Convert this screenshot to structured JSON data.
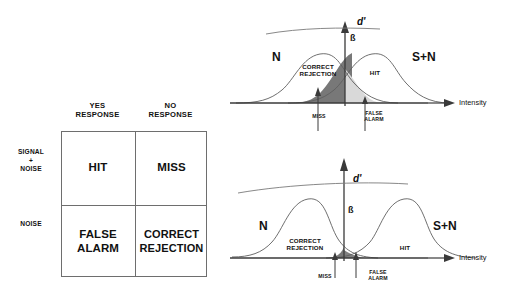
{
  "figure": {
    "background_color": "#ffffff",
    "line_color": "#6e6e6e",
    "text_color": "#111111",
    "dark_fill_color": "#787878",
    "light_fill_color": "#d9d9d9"
  },
  "matrix": {
    "column_headers": [
      {
        "id": "yes",
        "label": "YES\nRESPONSE"
      },
      {
        "id": "no",
        "label": "NO\nRESPONSE"
      }
    ],
    "row_headers": [
      {
        "id": "signal_noise",
        "label": "SIGNAL\n+\nNOISE"
      },
      {
        "id": "noise",
        "label": "NOISE"
      }
    ],
    "cells": [
      {
        "id": "hit",
        "row": "signal_noise",
        "col": "yes",
        "label": "HIT"
      },
      {
        "id": "miss",
        "row": "signal_noise",
        "col": "no",
        "label": "MISS"
      },
      {
        "id": "false_alarm",
        "row": "noise",
        "col": "yes",
        "label": "FALSE\nALARM"
      },
      {
        "id": "correct_rejection",
        "row": "noise",
        "col": "no",
        "label": "CORRECT\nREJECTION"
      }
    ]
  },
  "plots": [
    {
      "id": "low-sensitivity",
      "position": "top",
      "dprime_label": "d'",
      "beta_label": "ß",
      "noise_curve_label": "N",
      "signal_curve_label": "S+N",
      "axis_label": "Intensity",
      "region_labels": [
        {
          "id": "correct-rejection",
          "label": "CORRECT\nREJECTION"
        },
        {
          "id": "hit",
          "label": "HIT"
        }
      ],
      "arrow_labels": [
        {
          "id": "miss",
          "label": "MISS"
        },
        {
          "id": "false-alarm",
          "label": "FALSE\nALARM"
        }
      ],
      "chart_data": {
        "type": "area",
        "title": "Overlapping noise and signal+noise distributions (small d')",
        "xlabel": "Intensity",
        "ylabel": "",
        "grid": false,
        "legend": "inline",
        "xlim": [
          0,
          298
        ],
        "series": [
          {
            "name": "N",
            "distribution": "normal",
            "mean": 90,
            "sd": 26,
            "peak_height": 52
          },
          {
            "name": "S+N",
            "distribution": "normal",
            "mean": 142,
            "sd": 26,
            "peak_height": 52
          }
        ],
        "criterion_x": 115,
        "dprime_separation": 52,
        "shaded_regions": [
          {
            "name": "MISS",
            "series": "S+N",
            "range": "x < criterion",
            "fill": "#787878"
          },
          {
            "name": "FALSE ALARM",
            "series": "N",
            "range": "x > criterion",
            "fill": "#d9d9d9"
          }
        ]
      }
    },
    {
      "id": "high-sensitivity",
      "position": "bottom",
      "dprime_label": "d'",
      "beta_label": "ß",
      "noise_curve_label": "N",
      "signal_curve_label": "S+N",
      "axis_label": "Intensity",
      "region_labels": [
        {
          "id": "correct-rejection",
          "label": "CORRECT\nREJECTION"
        },
        {
          "id": "hit",
          "label": "HIT"
        }
      ],
      "arrow_labels": [
        {
          "id": "miss",
          "label": "MISS"
        },
        {
          "id": "false-alarm",
          "label": "FALSE\nALARM"
        }
      ],
      "chart_data": {
        "type": "area",
        "title": "Well separated noise and signal+noise distributions (large d')",
        "xlabel": "Intensity",
        "ylabel": "",
        "grid": false,
        "legend": "inline",
        "xlim": [
          0,
          298
        ],
        "series": [
          {
            "name": "N",
            "distribution": "normal",
            "mean": 77,
            "sd": 26,
            "peak_height": 62
          },
          {
            "name": "S+N",
            "distribution": "normal",
            "mean": 172,
            "sd": 26,
            "peak_height": 62
          }
        ],
        "criterion_x": 114,
        "dprime_separation": 95,
        "shaded_regions": [
          {
            "name": "MISS",
            "series": "S+N",
            "range": "x < criterion",
            "fill": "#787878"
          },
          {
            "name": "FALSE ALARM",
            "series": "N",
            "range": "x > criterion",
            "fill": "#d9d9d9"
          }
        ]
      }
    }
  ]
}
